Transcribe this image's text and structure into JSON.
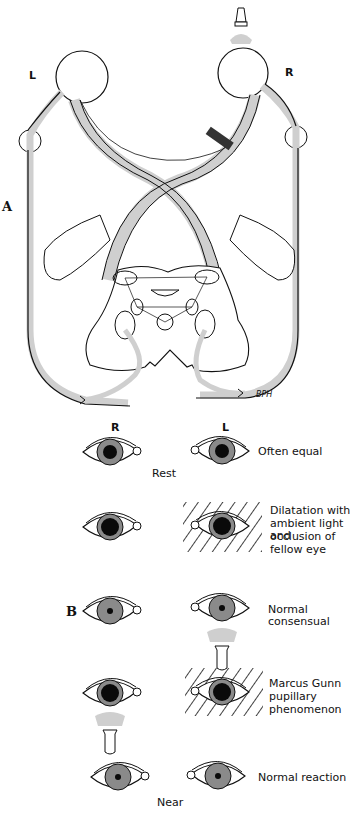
{
  "panel_a": {
    "label": "A",
    "left_eye_label": "L",
    "right_eye_label": "R",
    "signature": "BPH",
    "lesion": "right optic nerve lesion (dark band)",
    "light_source": "flashlight above right eye"
  },
  "panel_b": {
    "label": "B",
    "column_headers": {
      "right": "R",
      "left": "L"
    },
    "rows": [
      {
        "id": "rest",
        "caption": "Often equal",
        "sublabel": "Rest",
        "occluded": null,
        "light": null
      },
      {
        "id": "dilatation",
        "caption": "Dilatation with ambient light and occlusion of fellow eye",
        "occluded": "left",
        "light": null
      },
      {
        "id": "consensual",
        "caption": "Normal consensual",
        "occluded": null,
        "light": "left"
      },
      {
        "id": "marcus-gunn",
        "caption": "Marcus Gunn pupillary phenomenon",
        "occluded": "left",
        "light": "right"
      },
      {
        "id": "near",
        "caption": "Normal reaction",
        "sublabel": "Near",
        "occluded": null,
        "light": null
      }
    ],
    "caption_lines": {
      "dilatation": [
        "Dilatation with",
        "ambient light and",
        "occlusion of",
        "fellow eye"
      ],
      "marcus_gunn": [
        "Marcus Gunn",
        "pupillary",
        "phenomenon"
      ]
    }
  },
  "colors": {
    "line": "#111111",
    "pathway_fill": "#cfcfcf",
    "iris": "#8a8a8a",
    "pupil": "#0a0a0a",
    "lesion": "#333333"
  }
}
